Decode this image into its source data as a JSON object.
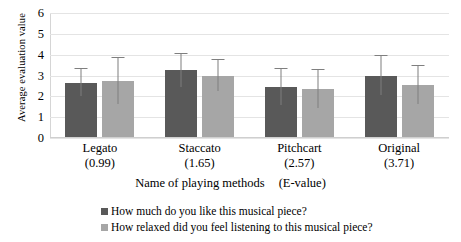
{
  "chart_data": {
    "type": "bar",
    "title": "",
    "xlabel": "Name of playing methods",
    "xlabel_unit": "(E-value)",
    "ylabel": "Average evaluation value",
    "ylim": [
      0,
      6
    ],
    "yticks": [
      0,
      1,
      2,
      3,
      4,
      5,
      6
    ],
    "grid": true,
    "legend_position": "bottom",
    "categories": [
      "Legato",
      "Staccato",
      "Pitchcart",
      "Original"
    ],
    "category_sublabels": [
      "(0.99)",
      "(1.65)",
      "(2.57)",
      "(3.71)"
    ],
    "e_values": [
      0.99,
      1.65,
      2.57,
      3.71
    ],
    "series": [
      {
        "name": "How much do you like this musical piece?",
        "color": "#595959",
        "values": [
          2.65,
          3.25,
          2.45,
          3.0
        ],
        "errors": [
          0.65,
          0.8,
          0.85,
          0.95
        ]
      },
      {
        "name": "How relaxed did you feel listening to this musical piece?",
        "color": "#a6a6a6",
        "values": [
          2.75,
          3.0,
          2.35,
          2.55
        ],
        "errors": [
          1.1,
          0.75,
          0.9,
          0.9
        ]
      }
    ]
  },
  "axes": {
    "y_title": "Average evaluation value",
    "y_tick_labels": [
      "6",
      "5",
      "4",
      "3",
      "2",
      "1",
      "0"
    ],
    "x_title": "Name of playing methods",
    "x_title_unit": "(E-value)"
  },
  "legend": {
    "items": [
      {
        "label": "How much do you like this musical piece?",
        "color": "#595959"
      },
      {
        "label": "How relaxed did you feel listening to this musical piece?",
        "color": "#a6a6a6"
      }
    ]
  },
  "colors": {
    "series_dark": "#595959",
    "series_light": "#a6a6a6",
    "gridline": "#e4e4e4",
    "error_bar": "#7f7f7f",
    "background": "#ffffff"
  }
}
